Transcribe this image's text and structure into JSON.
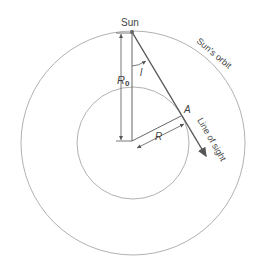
{
  "diagram": {
    "labels": {
      "sun": "Sun",
      "sun_orbit": "Sun's orbit",
      "r0": "R",
      "r0_sub": "0",
      "angle": "l",
      "point_a": "A",
      "radius": "R",
      "line_of_sight": "Line of sight"
    },
    "colors": {
      "circle": "#a8a8a8",
      "line": "#555555",
      "text": "#444444"
    }
  }
}
